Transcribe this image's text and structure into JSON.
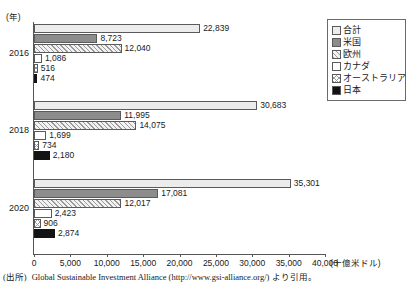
{
  "axis": {
    "y_unit_label": "(年)",
    "x_unit_label": "(十億米ドル)",
    "x_ticks": [
      "0",
      "5,000",
      "10,000",
      "15,000",
      "20,000",
      "25,000",
      "30,000",
      "35,000",
      "40,000"
    ]
  },
  "legend": {
    "items": [
      {
        "label": "合計",
        "key": "total"
      },
      {
        "label": "米国",
        "key": "us"
      },
      {
        "label": "欧州",
        "key": "europe"
      },
      {
        "label": "カナダ",
        "key": "canada"
      },
      {
        "label": "オーストラリア",
        "key": "australia"
      },
      {
        "label": "日本",
        "key": "japan"
      }
    ]
  },
  "source": {
    "label": "(出所)",
    "text": "Global Sustainable Investment Alliance (http://www.gsi-alliance.org/) より引用。"
  },
  "chart_data": {
    "type": "bar",
    "orientation": "horizontal",
    "title": "",
    "xlabel": "(十億米ドル)",
    "ylabel": "(年)",
    "xlim": [
      0,
      40000
    ],
    "xtick_step": 5000,
    "grid": false,
    "legend_position": "top-right",
    "categories": [
      "2016",
      "2018",
      "2020"
    ],
    "series": [
      {
        "name": "合計",
        "values": [
          22839,
          30683,
          35301
        ],
        "labels": [
          "22,839",
          "30,683",
          "35,301"
        ]
      },
      {
        "name": "米国",
        "values": [
          8723,
          11995,
          17081
        ],
        "labels": [
          "8,723",
          "11,995",
          "17,081"
        ]
      },
      {
        "name": "欧州",
        "values": [
          12040,
          14075,
          12017
        ],
        "labels": [
          "12,040",
          "14,075",
          "12,017"
        ]
      },
      {
        "name": "カナダ",
        "values": [
          1086,
          1699,
          2423
        ],
        "labels": [
          "1,086",
          "1,699",
          "2,423"
        ]
      },
      {
        "name": "オーストラリア",
        "values": [
          516,
          734,
          906
        ],
        "labels": [
          "516",
          "734",
          "906"
        ]
      },
      {
        "name": "日本",
        "values": [
          474,
          2180,
          2874
        ],
        "labels": [
          "474",
          "2,180",
          "2,874"
        ]
      }
    ]
  },
  "colors": {
    "total": "#ececec",
    "us": "#8c8c8c",
    "europe": "#f2f2f2",
    "canada": "#ffffff",
    "australia": "#ffffff",
    "japan": "#131313",
    "axis": "#555555"
  }
}
